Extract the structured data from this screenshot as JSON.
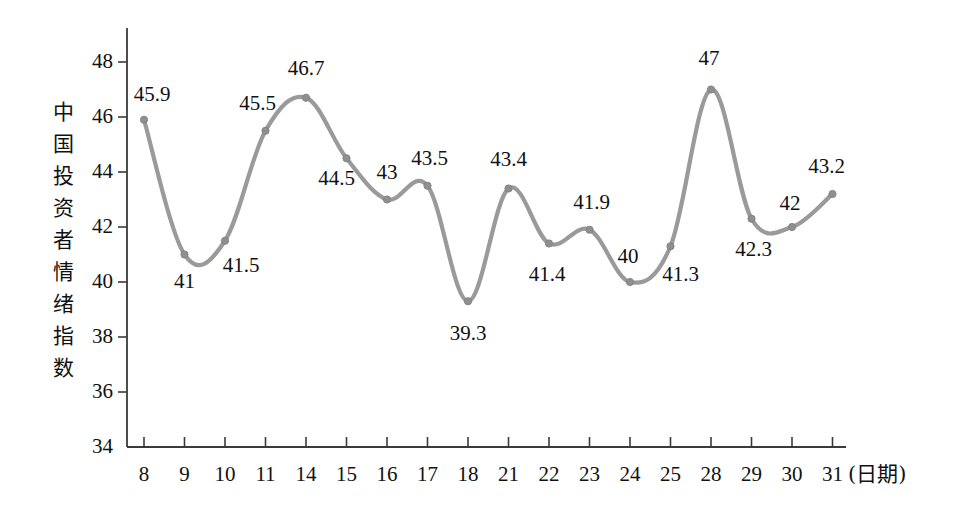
{
  "chart_data": {
    "type": "line",
    "title": "",
    "xlabel": "(日期)",
    "ylabel": "中国投资者情绪指数",
    "categories": [
      "8",
      "9",
      "10",
      "11",
      "14",
      "15",
      "16",
      "17",
      "18",
      "21",
      "22",
      "23",
      "24",
      "25",
      "28",
      "29",
      "30",
      "31"
    ],
    "values": [
      45.9,
      41,
      41.5,
      45.5,
      46.7,
      44.5,
      43,
      43.5,
      39.3,
      43.4,
      41.4,
      41.9,
      40,
      41.3,
      47,
      42.3,
      42,
      43.2
    ],
    "value_labels": [
      "45.9",
      "41",
      "41.5",
      "45.5",
      "46.7",
      "44.5",
      "43",
      "43.5",
      "39.3",
      "43.4",
      "41.4",
      "41.9",
      "40",
      "41.3",
      "47",
      "42.3",
      "42",
      "43.2"
    ],
    "series": [
      {
        "name": "中国投资者情绪指数",
        "values": [
          45.9,
          41,
          41.5,
          45.5,
          46.7,
          44.5,
          43,
          43.5,
          39.3,
          43.4,
          41.4,
          41.9,
          40,
          41.3,
          47,
          42.3,
          42,
          43.2
        ]
      }
    ],
    "ylim": [
      34,
      48
    ],
    "yticks": [
      "34",
      "36",
      "38",
      "40",
      "42",
      "44",
      "46",
      "48"
    ],
    "ytick_values": [
      34,
      36,
      38,
      40,
      42,
      44,
      46,
      48
    ],
    "grid": false,
    "legend": false,
    "line_color": "#9a9a9a",
    "marker_color": "#8f8f8f",
    "axis_color": "#3a3a3a",
    "background_color": "#ffffff",
    "smoothing": "spline"
  },
  "axes": {
    "y_caption_text": "中\n国\n投\n资\n者\n情\n绪\n指\n数",
    "x_caption_text": "(日期)"
  },
  "label_offsets": [
    {
      "dx": 8,
      "dy": -36,
      "anchor": "left"
    },
    {
      "dx": 0,
      "dy": 16,
      "anchor": "center"
    },
    {
      "dx": 16,
      "dy": 14,
      "anchor": "center"
    },
    {
      "dx": -8,
      "dy": -38,
      "anchor": "center"
    },
    {
      "dx": 0,
      "dy": -40,
      "anchor": "center"
    },
    {
      "dx": -10,
      "dy": 10,
      "anchor": "center"
    },
    {
      "dx": 0,
      "dy": -38,
      "anchor": "center"
    },
    {
      "dx": 2,
      "dy": -38,
      "anchor": "center"
    },
    {
      "dx": 0,
      "dy": 22,
      "anchor": "center"
    },
    {
      "dx": 0,
      "dy": -40,
      "anchor": "center"
    },
    {
      "dx": -2,
      "dy": 20,
      "anchor": "center"
    },
    {
      "dx": 2,
      "dy": -38,
      "anchor": "center"
    },
    {
      "dx": -2,
      "dy": -36,
      "anchor": "center"
    },
    {
      "dx": 10,
      "dy": 18,
      "anchor": "center"
    },
    {
      "dx": -2,
      "dy": -42,
      "anchor": "center"
    },
    {
      "dx": 2,
      "dy": 20,
      "anchor": "center"
    },
    {
      "dx": -2,
      "dy": -34,
      "anchor": "center"
    },
    {
      "dx": -6,
      "dy": -38,
      "anchor": "center"
    }
  ]
}
